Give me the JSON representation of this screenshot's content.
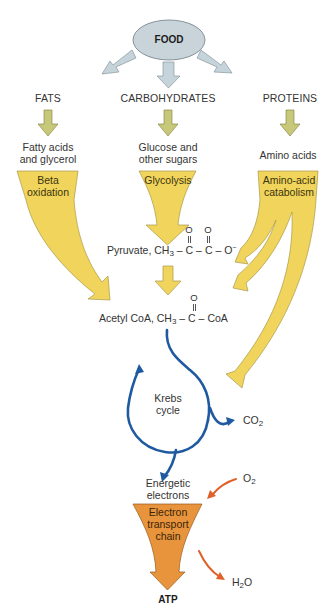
{
  "diagram": {
    "type": "metabolic-pathway",
    "source_node": {
      "label": "FOOD",
      "color": "#c9d4da"
    },
    "categories": [
      {
        "id": "fats",
        "label": "FATS",
        "product": [
          "Fatty acids",
          "and glycerol"
        ],
        "process": [
          "Beta",
          "oxidation"
        ]
      },
      {
        "id": "carbohydrates",
        "label": "CARBOHYDRATES",
        "product": [
          "Glucose and",
          "other sugars"
        ],
        "process": [
          "Glycolysis"
        ]
      },
      {
        "id": "proteins",
        "label": "PROTEINS",
        "product": [
          "Amino acids"
        ],
        "process": [
          "Amino-acid",
          "catabolism"
        ]
      }
    ],
    "pyruvate": {
      "name": "Pyruvate,",
      "formula": {
        "ch": "CH",
        "sub3": "3",
        "c1": "C",
        "c2": "C",
        "o": "O",
        "minus": "−",
        "oxygen": "O",
        "bond": "–"
      }
    },
    "acetyl_coa": {
      "name": "Acetyl CoA,",
      "formula": {
        "ch": "CH",
        "sub3": "3",
        "c": "C",
        "coa": "CoA",
        "oxygen": "O",
        "bond": "–"
      }
    },
    "krebs": {
      "label": [
        "Krebs",
        "cycle"
      ],
      "color": "#1f5aa0",
      "output": {
        "co": "CO",
        "sub": "2"
      }
    },
    "energetic": {
      "label": [
        "Energetic",
        "electrons"
      ]
    },
    "etc": {
      "label": [
        "Electron",
        "transport",
        "chain"
      ],
      "color": "#e8943c",
      "input": {
        "o": "O",
        "sub": "2"
      },
      "output": {
        "h": "H",
        "sub": "2",
        "o": "O"
      }
    },
    "final": {
      "label": "ATP"
    },
    "colors": {
      "food_arrow": "#c5d3da",
      "olive_arrow": "#c8c87a",
      "yellow_flow": "#f1d45c",
      "yellow_stroke": "#a89a4a",
      "blue_cycle": "#1f5aa0",
      "orange_etc": "#e8943c",
      "red_arrow": "#e0602a"
    }
  }
}
